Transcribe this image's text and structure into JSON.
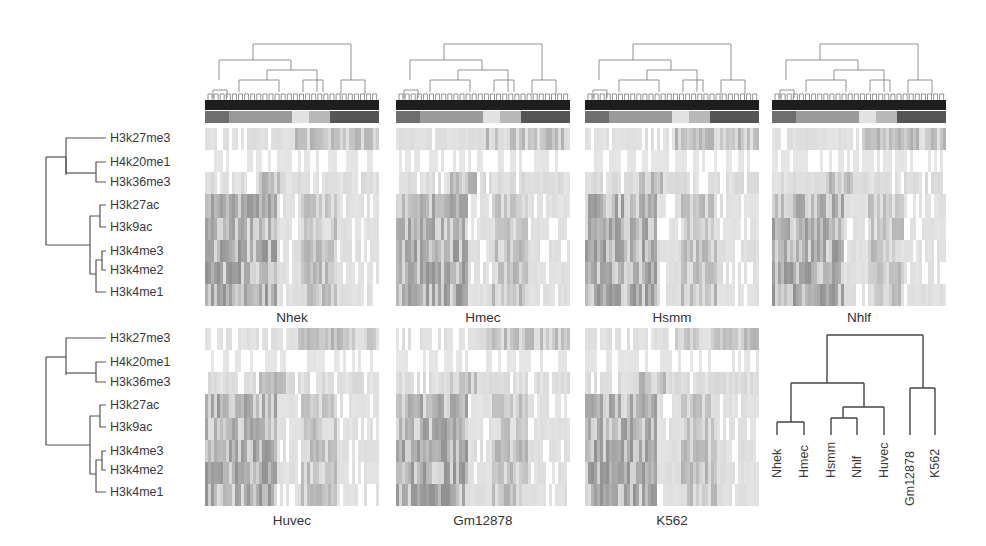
{
  "figure": {
    "histone_marks": [
      "H3k27me3",
      "H4k20me1",
      "H3k36me3",
      "H3k27ac",
      "H3k9ac",
      "H3k4me3",
      "H3k4me2",
      "H3k4me1"
    ],
    "row1_panels": [
      {
        "name": "Nhek",
        "x": 205
      },
      {
        "name": "Hmec",
        "x": 396
      },
      {
        "name": "Hsmm",
        "x": 585
      },
      {
        "name": "Nhlf",
        "x": 772
      }
    ],
    "row2_panels": [
      {
        "name": "Huvec",
        "x": 205
      },
      {
        "name": "Gm12878",
        "x": 396
      },
      {
        "name": "K562",
        "x": 585
      }
    ],
    "cluster_color_strip": [
      "#6e6e6e",
      "#9a9a9a",
      "#9a9a9a",
      "#e2e2e2",
      "#b8b8b8",
      "#555555"
    ],
    "cluster_color_widths": [
      14,
      20,
      16,
      10,
      12,
      28
    ],
    "cell_type_dendrogram": {
      "leaves": [
        "Nhek",
        "Hmec",
        "Hsmm",
        "Nhlf",
        "Huvec",
        "Gm12878",
        "K562"
      ]
    },
    "colors": {
      "background": "#ffffff",
      "heat_high": "#9c9c9c",
      "heat_mid": "#c8c8c8",
      "heat_low": "#ececec",
      "dendro_line": "#555555",
      "black_strip": "#1e1e1e"
    }
  }
}
